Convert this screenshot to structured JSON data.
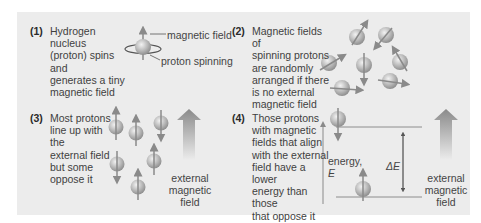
{
  "colors": {
    "background": "#ffffff",
    "panel": "#ececec",
    "text": "#3f3f3f",
    "proton": "#b5b5b5",
    "arrow": "#8a8a8a"
  },
  "panels": [
    {
      "number": "(1)",
      "lines": [
        "Hydrogen nucleus",
        "(proton) spins and",
        "generates a tiny",
        "magnetic field"
      ],
      "labels": {
        "field": "magnetic field",
        "spin": "proton spinning"
      }
    },
    {
      "number": "(2)",
      "lines": [
        "Magnetic fields of",
        "spinning protons",
        "are randomly",
        "arranged if there",
        "is no external",
        "magnetic field"
      ]
    },
    {
      "number": "(3)",
      "lines": [
        "Most protons",
        "line up with the",
        "external field",
        "but some",
        "oppose it"
      ],
      "arrow_label": [
        "external",
        "magnetic",
        "field"
      ]
    },
    {
      "number": "(4)",
      "lines": [
        "Those protons",
        "with magnetic",
        "fields that align",
        "with the external",
        "field have a lower",
        "energy than those",
        "that oppose it"
      ],
      "energy_label": [
        "energy,",
        "E"
      ],
      "delta_label": "ΔE",
      "arrow_label": [
        "external",
        "magnetic",
        "field"
      ]
    }
  ]
}
